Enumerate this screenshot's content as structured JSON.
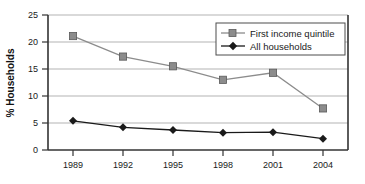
{
  "chart_data": {
    "type": "line",
    "title": "",
    "xlabel": "",
    "ylabel": "% Households",
    "categories": [
      "1989",
      "1992",
      "1995",
      "1998",
      "2001",
      "2004"
    ],
    "x": [
      1989,
      1992,
      1995,
      1998,
      2001,
      2004
    ],
    "series": [
      {
        "name": "First income quintile",
        "marker": "square",
        "color": "#8c8c8c",
        "line_color": "#8c8c8c",
        "values": [
          21.1,
          17.3,
          15.5,
          13.0,
          14.3,
          7.7
        ]
      },
      {
        "name": "All households",
        "marker": "diamond",
        "color": "#1a1a1a",
        "line_color": "#1a1a1a",
        "values": [
          5.4,
          4.2,
          3.7,
          3.2,
          3.3,
          2.1
        ]
      }
    ],
    "ylim": [
      0,
      25
    ],
    "yticks": [
      0,
      5,
      10,
      15,
      20,
      25
    ],
    "ytick_labels": [
      "0",
      "5",
      "10",
      "15",
      "20",
      "25"
    ],
    "xtick_labels": [
      "1989",
      "1992",
      "1995",
      "1998",
      "2001",
      "2004"
    ],
    "grid": "horizontal",
    "grid_color": "#b3b3b3",
    "legend_position": "top-right",
    "axis_color": "#333333",
    "background": "#ffffff"
  }
}
